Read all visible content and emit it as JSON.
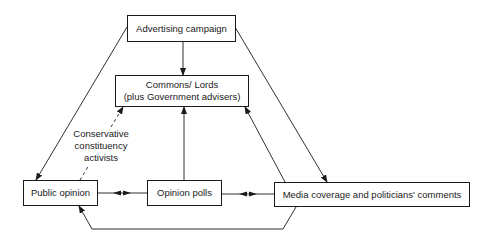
{
  "diagram": {
    "nodes": {
      "advertising": {
        "label": "Advertising campaign"
      },
      "commons_line1": "Commons/ Lords",
      "commons_line2": "(plus Government advisers)",
      "public_opinion": {
        "label": "Public opinion"
      },
      "opinion_polls": {
        "label": "Opinion polls"
      },
      "media": {
        "label": "Media coverage and politicians' comments"
      }
    },
    "edge_labels": {
      "activists_line1": "Conservative",
      "activists_line2": "constituency",
      "activists_line3": "activists"
    },
    "edges": [
      {
        "from": "Advertising campaign",
        "to": "Commons/Lords",
        "style": "solid"
      },
      {
        "from": "Advertising campaign",
        "to": "Public opinion",
        "style": "solid"
      },
      {
        "from": "Advertising campaign",
        "to": "Media coverage and politicians' comments",
        "style": "solid"
      },
      {
        "from": "Public opinion",
        "to": "Commons/Lords",
        "style": "dashed",
        "label": "Conservative constituency activists"
      },
      {
        "from": "Opinion polls",
        "to": "Commons/Lords",
        "style": "solid"
      },
      {
        "from": "Media coverage and politicians' comments",
        "to": "Commons/Lords",
        "style": "solid"
      },
      {
        "from": "Public opinion",
        "to": "Opinion polls",
        "style": "bidirectional"
      },
      {
        "from": "Opinion polls",
        "to": "Media coverage and politicians' comments",
        "style": "bidirectional"
      },
      {
        "from": "Media coverage and politicians' comments",
        "to": "Public opinion",
        "style": "solid"
      }
    ]
  }
}
